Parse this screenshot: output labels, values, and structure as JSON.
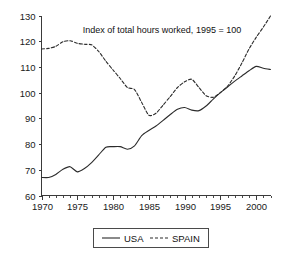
{
  "chart_data": {
    "type": "line",
    "title": "Index of total hours worked, 1995 = 100",
    "xlabel": "",
    "ylabel": "",
    "xlim": [
      1970,
      2002
    ],
    "ylim": [
      60,
      130
    ],
    "grid": false,
    "legend_position": "bottom-center",
    "y_ticks": [
      60,
      70,
      80,
      90,
      100,
      110,
      120,
      130
    ],
    "y_tick_labels": [
      "60",
      "70",
      "80",
      "90",
      "100",
      "110",
      "120",
      "130"
    ],
    "x_ticks": [
      1970,
      1975,
      1980,
      1985,
      1990,
      1995,
      2000
    ],
    "x_tick_labels": [
      "1970",
      "1975",
      "1980",
      "1985",
      "1990",
      "1995",
      "2000"
    ],
    "x_minor_tick_step": 1,
    "x": [
      1970,
      1971,
      1972,
      1973,
      1974,
      1975,
      1976,
      1977,
      1978,
      1979,
      1980,
      1981,
      1982,
      1983,
      1984,
      1985,
      1986,
      1987,
      1988,
      1989,
      1990,
      1991,
      1992,
      1993,
      1994,
      1995,
      1996,
      1997,
      1998,
      1999,
      2000,
      2001,
      2002
    ],
    "series": [
      {
        "name": "USA",
        "style": "solid",
        "color": "#2b2b2b",
        "values": [
          67.0,
          67.0,
          68.2,
          70.2,
          71.2,
          69.2,
          70.5,
          72.8,
          75.8,
          78.8,
          79.0,
          79.0,
          78.0,
          79.3,
          83.3,
          85.3,
          87.0,
          89.2,
          91.5,
          93.5,
          94.2,
          93.2,
          93.0,
          94.8,
          97.5,
          100.0,
          102.2,
          104.5,
          106.5,
          108.5,
          110.2,
          109.5,
          109.0
        ]
      },
      {
        "name": "SPAIN",
        "style": "dashed",
        "color": "#2b2b2b",
        "values": [
          117.0,
          117.2,
          118.0,
          119.8,
          120.2,
          119.2,
          118.8,
          118.6,
          116.0,
          112.2,
          108.8,
          105.5,
          102.0,
          101.2,
          96.2,
          91.2,
          92.0,
          95.2,
          98.5,
          102.0,
          104.2,
          105.2,
          102.0,
          98.8,
          98.2,
          100.0,
          102.5,
          106.5,
          111.5,
          117.0,
          121.5,
          125.5,
          129.8
        ]
      }
    ]
  },
  "legend": {
    "entries": [
      {
        "label": "USA",
        "style": "solid"
      },
      {
        "label": "SPAIN",
        "style": "dashed"
      }
    ]
  }
}
